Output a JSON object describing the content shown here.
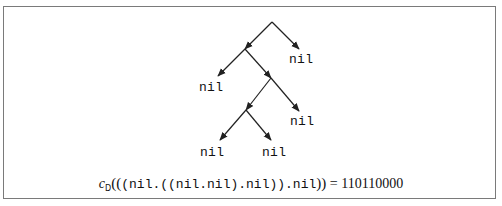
{
  "diagram": {
    "type": "binary-tree",
    "root": {
      "left": {
        "left": "nil",
        "right": {
          "left": {
            "left": "nil",
            "right": "nil"
          },
          "right": "nil"
        }
      },
      "right": "nil"
    },
    "leaves": [
      {
        "id": "leaf-root-right",
        "label": "nil"
      },
      {
        "id": "leaf-a-left",
        "label": "nil"
      },
      {
        "id": "leaf-b-right",
        "label": "nil"
      },
      {
        "id": "leaf-c-left",
        "label": "nil"
      },
      {
        "id": "leaf-c-right",
        "label": "nil"
      }
    ]
  },
  "caption": {
    "function": "c",
    "subscript": "D",
    "open": "((",
    "argument": "(nil.((nil.nil).nil)).nil",
    "close": "))",
    "equals": "=",
    "result": "110110000"
  },
  "colors": {
    "line": "#222222",
    "frame": "#7a7a7a",
    "text": "#111111"
  }
}
